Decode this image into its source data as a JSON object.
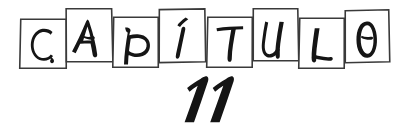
{
  "page": {
    "kind": "hand-drawn chapter heading",
    "background_color": "#ffffff",
    "ink_color": "#151515",
    "box_stroke_color": "#3a3a3a",
    "width": 406,
    "height": 129
  },
  "heading": {
    "word": "CAPÍTULO",
    "letters": [
      {
        "char": "C",
        "vertical_position": "low",
        "box": {
          "x": 20,
          "y": 19,
          "w": 46,
          "h": 49
        },
        "rotation": 0.6
      },
      {
        "char": "A",
        "vertical_position": "high",
        "box": {
          "x": 66,
          "y": 8,
          "w": 46,
          "h": 54
        },
        "rotation": -0.8
      },
      {
        "char": "P",
        "vertical_position": "low",
        "box": {
          "x": 113,
          "y": 17,
          "w": 45,
          "h": 50
        },
        "rotation": 0.5
      },
      {
        "char": "Í",
        "vertical_position": "high",
        "box": {
          "x": 159,
          "y": 9,
          "w": 46,
          "h": 53
        },
        "rotation": -0.4
      },
      {
        "char": "T",
        "vertical_position": "low",
        "box": {
          "x": 207,
          "y": 17,
          "w": 45,
          "h": 50
        },
        "rotation": 0.7
      },
      {
        "char": "U",
        "vertical_position": "high",
        "box": {
          "x": 253,
          "y": 8,
          "w": 45,
          "h": 53
        },
        "rotation": -0.5
      },
      {
        "char": "L",
        "vertical_position": "low",
        "box": {
          "x": 299,
          "y": 18,
          "w": 45,
          "h": 50
        },
        "rotation": 0.6
      },
      {
        "char": "O",
        "vertical_position": "high",
        "box": {
          "x": 345,
          "y": 10,
          "w": 44,
          "h": 52
        },
        "rotation": -0.6
      }
    ]
  },
  "chapter_number": {
    "value": "11",
    "style": "bold italic slanted",
    "position": {
      "x": 178,
      "y": 78,
      "w": 52,
      "h": 46
    }
  }
}
